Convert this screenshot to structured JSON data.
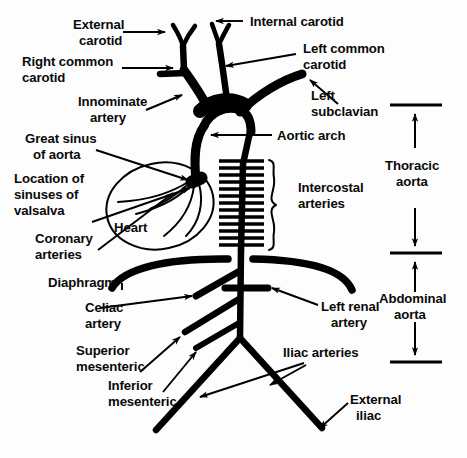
{
  "diagram": {
    "colors": {
      "ink": "#000000",
      "background": "#fdfdfd"
    },
    "labels": {
      "external_carotid_line1": "External",
      "external_carotid_line2": "carotid",
      "internal_carotid": "Internal carotid",
      "right_common_carotid_line1": "Right common",
      "right_common_carotid_line2": "carotid",
      "left_common_carotid_line1": "Left common",
      "left_common_carotid_line2": "carotid",
      "innominate_line1": "Innominate",
      "innominate_line2": "artery",
      "left_subclavian_line1": "Left",
      "left_subclavian_line2": "subclavian",
      "aortic_arch": "Aortic arch",
      "great_sinus_line1": "Great sinus",
      "great_sinus_line2": "of aorta",
      "sinuses_valsalva_line1": "Location of",
      "sinuses_valsalva_line2": "sinuses of",
      "sinuses_valsalva_line3": "valsalva",
      "coronary_line1": "Coronary",
      "coronary_line2": "arteries",
      "heart": "Heart",
      "intercostal_line1": "Intercostal",
      "intercostal_line2": "arteries",
      "thoracic_aorta_line1": "Thoracic",
      "thoracic_aorta_line2": "aorta",
      "abdominal_aorta_line1": "Abdominal",
      "abdominal_aorta_line2": "aorta",
      "diaphragm": "Diaphragm",
      "celiac_line1": "Celiac",
      "celiac_line2": "artery",
      "left_renal_line1": "Left renal",
      "left_renal_line2": "artery",
      "superior_mesenteric_line1": "Superior",
      "superior_mesenteric_line2": "mesenteric",
      "inferior_mesenteric_line1": "Inferior",
      "inferior_mesenteric_line2": "mesenteric",
      "iliac_arteries": "Iliac arteries",
      "external_iliac_line1": "External",
      "external_iliac_line2": "iliac"
    }
  }
}
